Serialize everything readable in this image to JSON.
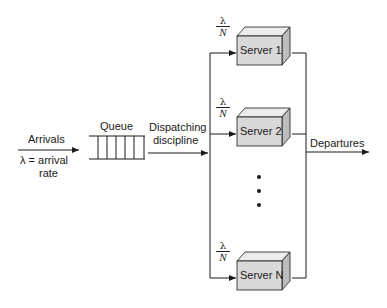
{
  "diagram": {
    "arrivals": {
      "label": "Arrivals",
      "rate_line1": "λ = arrival",
      "rate_line2": "rate"
    },
    "queue": {
      "label": "Queue",
      "slots": 6
    },
    "dispatcher": {
      "line1": "Dispatching",
      "line2": "discipline"
    },
    "servers": [
      {
        "label": "Server 1",
        "rate_num": "λ",
        "rate_den": "N"
      },
      {
        "label": "Server 2",
        "rate_num": "λ",
        "rate_den": "N"
      },
      {
        "label": "Server N",
        "rate_num": "λ",
        "rate_den": "N"
      }
    ],
    "ellipsis": "⋮",
    "departures": {
      "label": "Departures"
    },
    "colors": {
      "line": "#1a1a1a",
      "server_fill": "#d9d9d9",
      "server_top": "#ececec",
      "server_side": "#bdbdbd"
    }
  }
}
